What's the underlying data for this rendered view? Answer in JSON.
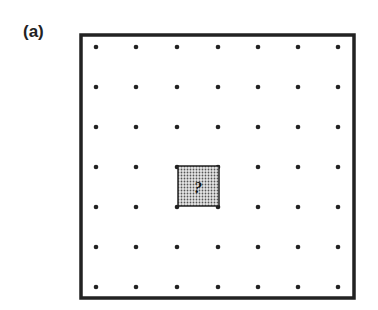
{
  "figure": {
    "panel_label": "(a)",
    "grid": {
      "rows": 7,
      "cols": 7,
      "x": [
        96,
        136,
        177,
        218,
        258,
        298,
        338
      ],
      "y": [
        47,
        87,
        127,
        167,
        207,
        247,
        287
      ]
    },
    "missing_cell": {
      "row": 3,
      "col": 2,
      "label": "?"
    },
    "frame_color": "#222222",
    "fill_color": "#bdbdbd"
  }
}
